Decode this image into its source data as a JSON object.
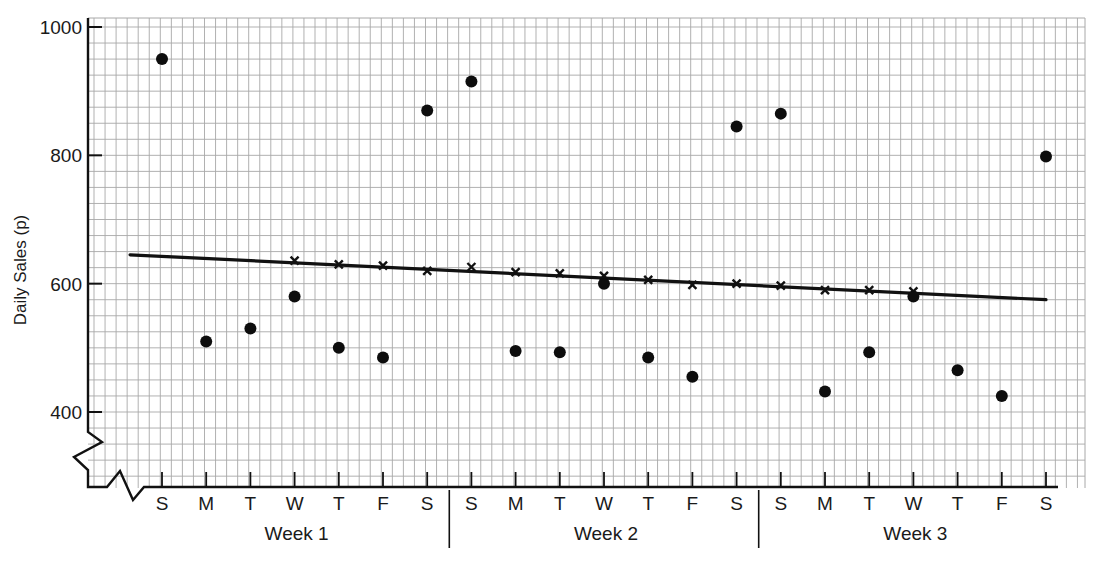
{
  "chart_data": {
    "type": "scatter",
    "title": "",
    "xlabel": "",
    "ylabel": "Daily Sales (p)",
    "ylim": [
      300,
      1000
    ],
    "y_ticks": [
      400,
      600,
      800,
      1000
    ],
    "y_axis_break": true,
    "grid": true,
    "categories": [
      "S",
      "M",
      "T",
      "W",
      "T",
      "F",
      "S",
      "S",
      "M",
      "T",
      "W",
      "T",
      "F",
      "S",
      "S",
      "M",
      "T",
      "W",
      "T",
      "F",
      "S",
      "S"
    ],
    "groups": [
      {
        "label": "Week 1",
        "start": 0,
        "end": 6
      },
      {
        "label": "Week 2",
        "start": 7,
        "end": 13
      },
      {
        "label": "Week 3",
        "start": 14,
        "end": 20
      }
    ],
    "series": [
      {
        "name": "Daily sales",
        "marker": "dot",
        "values": [
          950,
          510,
          530,
          580,
          500,
          485,
          870,
          915,
          495,
          493,
          600,
          485,
          455,
          845,
          865,
          432,
          493,
          580,
          465,
          425,
          798,
          null
        ]
      },
      {
        "name": "Moving average",
        "marker": "cross",
        "values": [
          null,
          null,
          null,
          636,
          630,
          628,
          620,
          626,
          618,
          616,
          612,
          606,
          598,
          600,
          597,
          590,
          590,
          588,
          null,
          null,
          null,
          null
        ]
      },
      {
        "name": "Trend line",
        "type": "line",
        "x_start": 0,
        "x_end": 20,
        "y_start": 645,
        "y_end": 575
      }
    ]
  }
}
